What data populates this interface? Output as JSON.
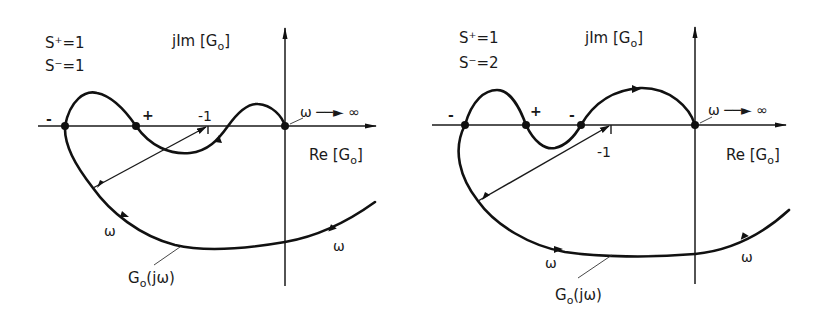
{
  "figure": {
    "left": {
      "s_plus": "S⁺=1",
      "s_minus": "S⁻=1",
      "im_axis_label": "jIm [G",
      "im_axis_sub": "o",
      "im_axis_close": "]",
      "re_axis_label": "Re [G",
      "re_axis_sub": "o",
      "re_axis_close": "]",
      "minus_one": "-1",
      "omega_inf": "ω ──► ∞",
      "crossings": [
        "-",
        "+"
      ],
      "omega_left": "ω",
      "omega_right": "ω",
      "curve_label": "G",
      "curve_label_sub": "o",
      "curve_label_arg": "(jω)"
    },
    "right": {
      "s_plus": "S⁺=1",
      "s_minus": "S⁻=2",
      "im_axis_label": "jIm [G",
      "im_axis_sub": "o",
      "im_axis_close": "]",
      "re_axis_label": "Re [G",
      "re_axis_sub": "o",
      "re_axis_close": "]",
      "minus_one": "-1",
      "omega_inf": "ω ──► ∞",
      "crossings": [
        "-",
        "+",
        "-"
      ],
      "omega_left": "ω",
      "omega_right": "ω",
      "curve_label": "G",
      "curve_label_sub": "o",
      "curve_label_arg": "(jω)"
    }
  },
  "colors": {
    "ink": "#111111",
    "background": "#ffffff"
  }
}
